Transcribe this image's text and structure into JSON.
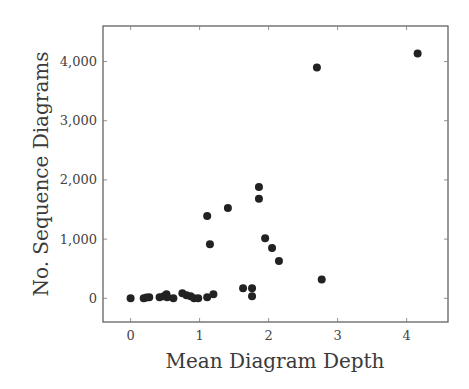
{
  "chart_data": {
    "type": "scatter",
    "title": "",
    "xlabel": "Mean Diagram Depth",
    "ylabel": "No. Sequence Diagrams",
    "xlim": [
      -0.4,
      4.6
    ],
    "ylim": [
      -400,
      4600
    ],
    "xticks": [
      0,
      1,
      2,
      3,
      4
    ],
    "xtick_labels": [
      "0",
      "1",
      "2",
      "3",
      "4"
    ],
    "yticks": [
      0,
      1000,
      2000,
      3000,
      4000
    ],
    "ytick_labels": [
      "0",
      "1,000",
      "2,000",
      "3,000",
      "4,000"
    ],
    "grid": false,
    "legend": null,
    "marker_color": "#222222",
    "series": [
      {
        "name": "diagrams",
        "points": [
          {
            "x": 0.0,
            "y": 0
          },
          {
            "x": 0.19,
            "y": 0
          },
          {
            "x": 0.23,
            "y": 15
          },
          {
            "x": 0.27,
            "y": 20
          },
          {
            "x": 0.42,
            "y": 20
          },
          {
            "x": 0.48,
            "y": 35
          },
          {
            "x": 0.52,
            "y": 70
          },
          {
            "x": 0.53,
            "y": 20
          },
          {
            "x": 0.62,
            "y": 0
          },
          {
            "x": 0.75,
            "y": 85
          },
          {
            "x": 0.81,
            "y": 50
          },
          {
            "x": 0.87,
            "y": 35
          },
          {
            "x": 0.92,
            "y": 0
          },
          {
            "x": 0.98,
            "y": 0
          },
          {
            "x": 1.11,
            "y": 20
          },
          {
            "x": 1.2,
            "y": 70
          },
          {
            "x": 1.11,
            "y": 1390
          },
          {
            "x": 1.15,
            "y": 915
          },
          {
            "x": 1.41,
            "y": 1525
          },
          {
            "x": 1.63,
            "y": 170
          },
          {
            "x": 1.76,
            "y": 170
          },
          {
            "x": 1.76,
            "y": 35
          },
          {
            "x": 1.86,
            "y": 1880
          },
          {
            "x": 1.86,
            "y": 1680
          },
          {
            "x": 1.95,
            "y": 1015
          },
          {
            "x": 2.05,
            "y": 850
          },
          {
            "x": 2.15,
            "y": 630
          },
          {
            "x": 2.7,
            "y": 3900
          },
          {
            "x": 2.77,
            "y": 320
          },
          {
            "x": 4.16,
            "y": 4135
          }
        ]
      }
    ]
  }
}
